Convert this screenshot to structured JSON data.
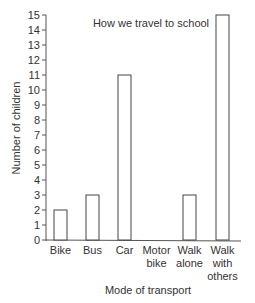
{
  "chart_data": {
    "type": "bar",
    "title": "How we travel to school",
    "xlabel": "Mode of transport",
    "ylabel": "Number of children",
    "categories": [
      "Bike",
      "Bus",
      "Car",
      "Motor bike",
      "Walk alone",
      "Walk with others"
    ],
    "category_lines": [
      [
        "Bike"
      ],
      [
        "Bus"
      ],
      [
        "Car"
      ],
      [
        "Motor",
        "bike"
      ],
      [
        "Walk",
        "alone"
      ],
      [
        "Walk",
        "with",
        "others"
      ]
    ],
    "values": [
      2,
      3,
      11,
      0,
      3,
      15
    ],
    "ylim": [
      0,
      15
    ],
    "yticks": [
      0,
      1,
      2,
      3,
      4,
      5,
      6,
      7,
      8,
      9,
      10,
      11,
      12,
      13,
      14,
      15
    ],
    "grid": false,
    "bar_fill": "#ffffff",
    "bar_stroke": "#444444"
  }
}
